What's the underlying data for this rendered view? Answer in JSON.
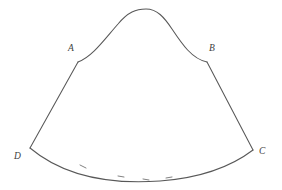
{
  "figure": {
    "name": "closed-curve-figure-ABCD",
    "background_color": "#ffffff",
    "stroke_color": "#585858",
    "tick_color": "#6a6a6a",
    "label_color": "#3d3d3d",
    "stroke_width": 1.05,
    "canvas": {
      "width": 282,
      "height": 190
    },
    "labels": [
      {
        "id": "A",
        "text": "A",
        "x": 68,
        "y": 44
      },
      {
        "id": "B",
        "text": "B",
        "x": 209,
        "y": 44
      },
      {
        "id": "C",
        "text": "C",
        "x": 259,
        "y": 147
      },
      {
        "id": "D",
        "text": "D",
        "x": 14,
        "y": 152
      }
    ],
    "vertices": [
      {
        "id": "A",
        "x": 78,
        "y": 62
      },
      {
        "id": "B",
        "x": 207,
        "y": 62
      },
      {
        "id": "C",
        "x": 253,
        "y": 150
      },
      {
        "id": "D",
        "x": 30,
        "y": 148
      }
    ],
    "apex": {
      "x": 145,
      "y": 9
    },
    "paths": {
      "top_curve_AB": "M 78 62 C 92 57 104 40 118 24 C 128 12 136 9 146 9 C 157 9 164 17 172 29 C 182 44 192 59 207 62",
      "left_side_AD": "M 78 62 L 30 148",
      "right_side_BC": "M 207 62 L 253 150",
      "bottom_arc_DC": "M 30 148 C 68 180 118 184 160 181 C 200 178 232 166 253 150"
    },
    "tick_marks": [
      {
        "x1": 80,
        "y1": 165,
        "x2": 86,
        "y2": 168
      },
      {
        "x1": 118,
        "y1": 176,
        "x2": 124,
        "y2": 177
      },
      {
        "x1": 143,
        "y1": 179,
        "x2": 149,
        "y2": 180
      },
      {
        "x1": 166,
        "y1": 178,
        "x2": 172,
        "y2": 177
      }
    ]
  }
}
